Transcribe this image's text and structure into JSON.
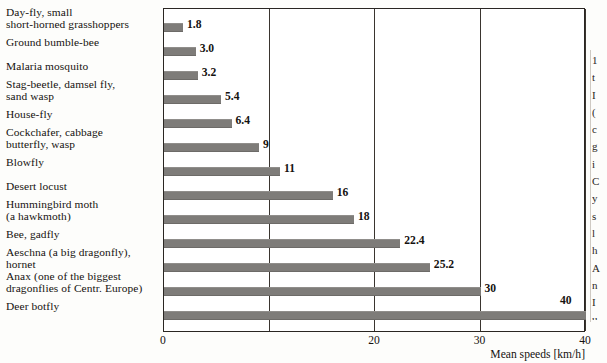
{
  "page": {
    "top_cut_text": "",
    "right_column_fragments": [
      "1",
      "t",
      "I",
      "(",
      "c",
      "g",
      "i",
      "C",
      "y",
      "s",
      "l",
      "h",
      "A",
      "n",
      "I",
      "u",
      "s",
      "a"
    ]
  },
  "axis": {
    "title": "Mean speeds [km/h]",
    "ticks": [
      {
        "value": 0,
        "label": "0"
      },
      {
        "value": 10,
        "label": ""
      },
      {
        "value": 20,
        "label": "20"
      },
      {
        "value": 30,
        "label": "30"
      },
      {
        "value": 40,
        "label": "40"
      }
    ]
  },
  "chart_data": {
    "type": "bar",
    "orientation": "horizontal",
    "title": "",
    "subtitle": "",
    "xlabel": "Mean speeds [km/h]",
    "ylabel": "",
    "xlim": [
      0,
      40
    ],
    "grid": true,
    "gridlines_x": [
      10,
      20,
      30,
      40
    ],
    "legend": null,
    "bar_color": "#7e7c79",
    "categories": [
      "Day-fly, small short-horned grasshoppers",
      "Ground bumble-bee",
      "Malaria mosquito",
      "Stag-beetle, damsel fly, sand wasp",
      "House-fly",
      "Cockchafer, cabbage butterfly, wasp",
      "Blowfly",
      "Desert locust",
      "Hummingbird moth (a hawkmoth)",
      "Bee, gadfly",
      "Aeschna (a big dragonfly), hornet",
      "Anax (one of the biggest dragonflies of Centr. Europe)",
      "Deer botfly"
    ],
    "category_lines": [
      [
        "Day-fly, small",
        "short-horned grasshoppers"
      ],
      [
        "Ground bumble-bee"
      ],
      [
        "Malaria mosquito"
      ],
      [
        "Stag-beetle, damsel fly,",
        "sand wasp"
      ],
      [
        "House-fly"
      ],
      [
        "Cockchafer, cabbage",
        "butterfly, wasp"
      ],
      [
        "Blowfly"
      ],
      [
        "Desert locust"
      ],
      [
        "Hummingbird moth",
        "(a hawkmoth)"
      ],
      [
        "Bee, gadfly"
      ],
      [
        "Aeschna (a big dragonfly),",
        "hornet"
      ],
      [
        "Anax (one of the biggest",
        "dragonflies of Centr. Europe)"
      ],
      [
        "Deer botfly"
      ]
    ],
    "values": [
      1.8,
      3.0,
      3.2,
      5.4,
      6.4,
      9,
      11,
      16,
      18,
      22.4,
      25.2,
      30,
      40
    ],
    "value_labels": [
      "1.8",
      "3.0",
      "3.2",
      "5.4",
      "6.4",
      "9",
      "11",
      "16",
      "18",
      "22.4",
      "25.2",
      "30",
      "40"
    ]
  }
}
